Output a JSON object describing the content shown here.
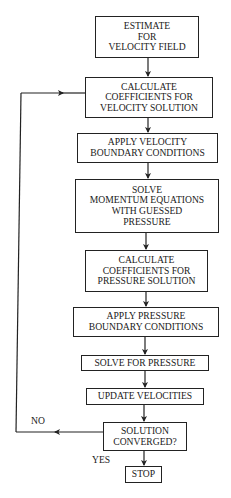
{
  "diagram": {
    "type": "flowchart",
    "title": "",
    "steps": [
      {
        "id": "estimate",
        "lines": [
          "ESTIMATE",
          "FOR",
          "VELOCITY FIELD"
        ],
        "box": {
          "x": 95,
          "y": 16,
          "w": 104,
          "h": 42
        }
      },
      {
        "id": "calc-velocity-coeffs",
        "lines": [
          "CALCULATE",
          "COEFFICIENTS FOR",
          "VELOCITY SOLUTION"
        ],
        "box": {
          "x": 85,
          "y": 77,
          "w": 128,
          "h": 41
        }
      },
      {
        "id": "apply-velocity-bc",
        "lines": [
          "APPLY VELOCITY",
          "BOUNDARY CONDITIONS"
        ],
        "box": {
          "x": 77,
          "y": 133,
          "w": 141,
          "h": 30
        }
      },
      {
        "id": "solve-momentum",
        "lines": [
          "SOLVE",
          "MOMENTUM EQUATIONS",
          "WITH GUESSED",
          "PRESSURE"
        ],
        "box": {
          "x": 75,
          "y": 179,
          "w": 144,
          "h": 54
        }
      },
      {
        "id": "calc-pressure-coeffs",
        "lines": [
          "CALCULATE",
          "COEFFICIENTS FOR",
          "PRESSURE SOLUTION"
        ],
        "box": {
          "x": 85,
          "y": 250,
          "w": 123,
          "h": 42
        }
      },
      {
        "id": "apply-pressure-bc",
        "lines": [
          "APPLY PRESSURE",
          "BOUNDARY CONDITIONS"
        ],
        "box": {
          "x": 73,
          "y": 307,
          "w": 146,
          "h": 30
        }
      },
      {
        "id": "solve-pressure",
        "lines": [
          "SOLVE FOR PRESSURE"
        ],
        "box": {
          "x": 81,
          "y": 355,
          "w": 128,
          "h": 16
        }
      },
      {
        "id": "update-velocities",
        "lines": [
          "UPDATE VELOCITIES"
        ],
        "box": {
          "x": 86,
          "y": 388,
          "w": 118,
          "h": 17
        }
      },
      {
        "id": "converged",
        "lines": [
          "SOLUTION",
          "CONVERGED?"
        ],
        "box": {
          "x": 103,
          "y": 422,
          "w": 84,
          "h": 29
        }
      },
      {
        "id": "stop",
        "lines": [
          "STOP"
        ],
        "box": {
          "x": 125,
          "y": 466,
          "w": 37,
          "h": 17
        }
      }
    ],
    "branch_labels": {
      "no": "NO",
      "yes": "YES"
    },
    "edges": [
      {
        "from": "estimate",
        "to": "calc-velocity-coeffs"
      },
      {
        "from": "calc-velocity-coeffs",
        "to": "apply-velocity-bc"
      },
      {
        "from": "apply-velocity-bc",
        "to": "solve-momentum"
      },
      {
        "from": "solve-momentum",
        "to": "calc-pressure-coeffs"
      },
      {
        "from": "calc-pressure-coeffs",
        "to": "apply-pressure-bc"
      },
      {
        "from": "apply-pressure-bc",
        "to": "solve-pressure"
      },
      {
        "from": "solve-pressure",
        "to": "update-velocities"
      },
      {
        "from": "update-velocities",
        "to": "converged"
      },
      {
        "from": "converged",
        "to": "stop",
        "label": "YES"
      },
      {
        "from": "converged",
        "to": "calc-velocity-coeffs",
        "label": "NO"
      }
    ],
    "colors": {
      "stroke": "#222222",
      "text": "#1a1a1a",
      "background": "#ffffff"
    }
  }
}
